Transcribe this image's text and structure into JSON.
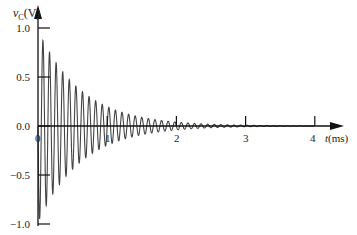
{
  "chart_data": {
    "type": "line",
    "title": "",
    "xlabel": "t(ms)",
    "ylabel": "vC(V)",
    "ylabel_parts": {
      "var": "v",
      "sub": "C",
      "unit": "(V)"
    },
    "xlabel_parts": {
      "var": "t",
      "unit": "(ms)"
    },
    "xlim": [
      0,
      4.3
    ],
    "ylim": [
      -1.0,
      1.0
    ],
    "x_ticks": [
      0,
      1,
      2,
      3,
      4
    ],
    "x_tick_labels": [
      "0",
      "1",
      "2",
      "3",
      "4"
    ],
    "y_ticks": [
      1.0,
      0.5,
      0.0,
      -0.5,
      -1.0
    ],
    "y_tick_labels": [
      "1.0",
      "0.5",
      "0.0",
      "−0.5",
      "−1.0"
    ],
    "grid": false,
    "legend": null,
    "series": [
      {
        "name": "vC(t)",
        "description": "Underdamped decaying sinusoid: vC(t) = -e^(-alpha t) sin(omega t)",
        "alpha_per_ms": 1.6,
        "frequency_khz": 10.5,
        "initial_value": 0.0,
        "first_trough": {
          "t_ms": 0.04,
          "v": -0.95
        },
        "first_peak": {
          "t_ms": 0.14,
          "v": 0.89
        },
        "envelope": [
          {
            "t_ms": 0.0,
            "v": 1.0
          },
          {
            "t_ms": 0.5,
            "v": 0.45
          },
          {
            "t_ms": 1.0,
            "v": 0.2
          },
          {
            "t_ms": 1.5,
            "v": 0.09
          },
          {
            "t_ms": 2.0,
            "v": 0.04
          },
          {
            "t_ms": 3.0,
            "v": 0.01
          },
          {
            "t_ms": 4.0,
            "v": 0.0
          }
        ]
      }
    ],
    "color": "#333333"
  }
}
